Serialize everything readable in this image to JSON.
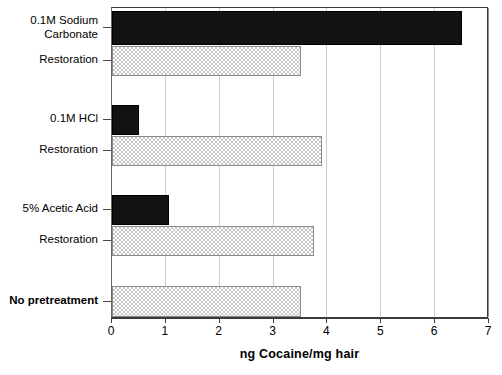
{
  "chart_data": {
    "type": "bar",
    "orientation": "horizontal",
    "title": "",
    "xlabel": "ng Cocaine/mg hair",
    "ylabel": "",
    "xlim": [
      0,
      7
    ],
    "ylim": null,
    "grid": "vertical",
    "legend": null,
    "xticks": [
      "0",
      "1",
      "2",
      "3",
      "4",
      "5",
      "6",
      "7"
    ],
    "xtick_values": [
      0,
      1,
      2,
      3,
      4,
      5,
      6,
      7
    ],
    "categories": [
      "0.1M Sodium\nCarbonate",
      "Restoration",
      "0.1M HCl",
      "Restoration",
      "5% Acetic Acid",
      "Restoration",
      "No pretreatment"
    ],
    "values": [
      6.5,
      3.5,
      0.5,
      3.9,
      1.05,
      3.75,
      3.5
    ],
    "bars": [
      {
        "label": "0.1M Sodium\nCarbonate",
        "value": 6.5,
        "style": "solid",
        "bold": false
      },
      {
        "label": "Restoration",
        "value": 3.5,
        "style": "hatched",
        "bold": false
      },
      {
        "label": "0.1M HCl",
        "value": 0.5,
        "style": "solid",
        "bold": false
      },
      {
        "label": "Restoration",
        "value": 3.9,
        "style": "hatched",
        "bold": false
      },
      {
        "label": "5% Acetic Acid",
        "value": 1.05,
        "style": "solid",
        "bold": false
      },
      {
        "label": "Restoration",
        "value": 3.75,
        "style": "hatched",
        "bold": false
      },
      {
        "label": "No pretreatment",
        "value": 3.5,
        "style": "hatched",
        "bold": true
      }
    ],
    "colors": {
      "solid_bar": "#121212",
      "hatched_bar_fill": "#c8c8c8",
      "hatched_bar_border": "#8a8a8a",
      "gridline": "#cdcdcd",
      "axis": "#3a3a3a",
      "background": "#ffffff",
      "text": "#000000"
    }
  }
}
